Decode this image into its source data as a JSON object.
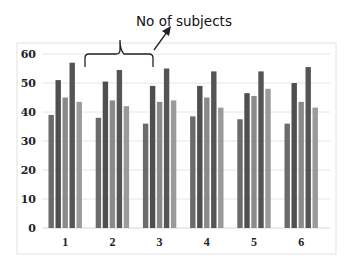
{
  "chart_data": {
    "type": "bar",
    "title": "",
    "xlabel": "",
    "ylabel": "",
    "ylim": [
      0,
      60
    ],
    "yticks": [
      0,
      10,
      20,
      30,
      40,
      50,
      60
    ],
    "grid": true,
    "legend": null,
    "categories": [
      "1",
      "2",
      "3",
      "4",
      "5",
      "6"
    ],
    "series": [
      {
        "name": "Series 1",
        "color": "#6b6b6b",
        "values": [
          39,
          38,
          36,
          38.5,
          37.5,
          36
        ]
      },
      {
        "name": "Series 2",
        "color": "#4f4f4f",
        "values": [
          51,
          50.5,
          49,
          49,
          46.5,
          50
        ]
      },
      {
        "name": "Series 3",
        "color": "#8a8a8a",
        "values": [
          45,
          44,
          43.5,
          45,
          45.5,
          43.5
        ]
      },
      {
        "name": "Series 4",
        "color": "#555555",
        "values": [
          57,
          54.5,
          55,
          54,
          54,
          55.5
        ]
      },
      {
        "name": "Series 5",
        "color": "#9a9a9a",
        "values": [
          43.5,
          42,
          44,
          41.5,
          48,
          41.5
        ]
      }
    ],
    "annotations": [
      {
        "text": "No of subjects",
        "type": "brace-with-arrow",
        "target": "bars between categories 1 and 3"
      }
    ]
  },
  "annotation": {
    "label": "No of subjects"
  }
}
